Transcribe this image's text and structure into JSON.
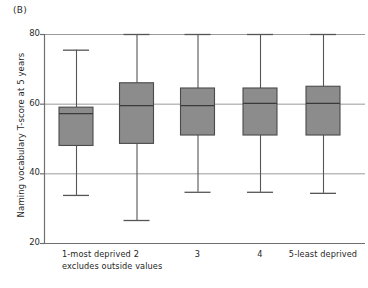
{
  "panel": {
    "label": "(B)"
  },
  "axes": {
    "y_title": "Naming vocabulary T-score at 5 years",
    "y_ticks": [
      "80",
      "60",
      "40",
      "20"
    ],
    "x_ticks": [
      "1-most deprived",
      "2",
      "3",
      "4",
      "5-least deprived"
    ],
    "footnote": "excludes outside values"
  },
  "colors": {
    "box_fill": "#8c8c8c",
    "box_stroke": "#4a4a4a",
    "axis": "#6f6f6f",
    "grid": "#9a9a9a",
    "whisker": "#555555",
    "text": "#1f1f1f"
  },
  "chart_data": {
    "type": "box",
    "title": "(B)",
    "xlabel": "",
    "ylabel": "Naming vocabulary T-score at 5 years",
    "ylim": [
      20,
      80
    ],
    "yticks": [
      20,
      40,
      60,
      80
    ],
    "grid": true,
    "legend": "none",
    "annotations": [
      "excludes outside values"
    ],
    "categories": [
      "1-most deprived",
      "2",
      "3",
      "4",
      "5-least deprived"
    ],
    "boxes": [
      {
        "category": "1-most deprived",
        "whisker_low": 33.8,
        "q1": 48.0,
        "median": 57.3,
        "q3": 59.0,
        "whisker_high": 75.5
      },
      {
        "category": "2",
        "whisker_low": 26.6,
        "q1": 48.6,
        "median": 59.6,
        "q3": 66.0,
        "whisker_high": 80.0
      },
      {
        "category": "3",
        "whisker_low": 34.7,
        "q1": 51.0,
        "median": 59.6,
        "q3": 64.5,
        "whisker_high": 80.0
      },
      {
        "category": "4",
        "whisker_low": 34.7,
        "q1": 51.0,
        "median": 60.2,
        "q3": 64.5,
        "whisker_high": 80.0
      },
      {
        "category": "5-least deprived",
        "whisker_low": 34.4,
        "q1": 51.0,
        "median": 60.2,
        "q3": 65.0,
        "whisker_high": 80.0
      }
    ]
  },
  "geometry": {
    "plot_left": 44,
    "plot_right": 365,
    "plot_top": 34,
    "plot_bottom": 243,
    "box_half_width": 17,
    "centers": [
      76,
      136.5,
      197.5,
      260,
      323
    ],
    "ytick_y": {
      "80": 34,
      "60": 103.5,
      "40": 173,
      "20": 243
    },
    "xlabel_y": 249,
    "footnote_xy": [
      62,
      261
    ]
  }
}
